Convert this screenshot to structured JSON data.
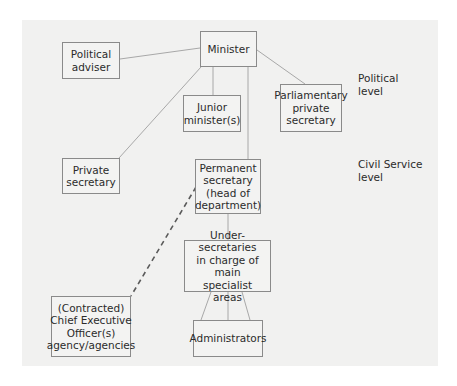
{
  "diagram": {
    "type": "organisation-chart",
    "nodes": {
      "minister": "Minister",
      "political_adviser": "Political\nadviser",
      "junior_minister": "Junior\nminister(s)",
      "parliamentary_private_secretary": "Parliamentary\nprivate\nsecretary",
      "private_secretary": "Private\nsecretary",
      "permanent_secretary": "Permanent\nsecretary\n(head of\ndepartment)",
      "under_secretaries": "Under-secretaries\nin charge of main\nspecialist areas",
      "administrators": "Administrators",
      "chief_executive": "(Contracted)\nChief Executive\nOfficer(s)\nagency/agencies"
    },
    "levels": {
      "political": "Political\nlevel",
      "civil_service": "Civil Service\nlevel"
    },
    "edges": [
      {
        "from": "minister",
        "to": "political_adviser",
        "style": "solid"
      },
      {
        "from": "minister",
        "to": "junior_minister",
        "style": "solid"
      },
      {
        "from": "minister",
        "to": "parliamentary_private_secretary",
        "style": "solid"
      },
      {
        "from": "minister",
        "to": "private_secretary",
        "style": "solid"
      },
      {
        "from": "minister",
        "to": "permanent_secretary",
        "style": "solid"
      },
      {
        "from": "permanent_secretary",
        "to": "under_secretaries",
        "style": "solid"
      },
      {
        "from": "under_secretaries",
        "to": "administrators",
        "style": "solid",
        "count": 3
      },
      {
        "from": "permanent_secretary",
        "to": "chief_executive",
        "style": "dashed"
      }
    ],
    "colors": {
      "panel": "#f1f1f0",
      "border": "#8a8a8a",
      "line": "#a8a8a8",
      "dashed_line": "#5a5a5a",
      "text": "#2b2b2b"
    }
  }
}
